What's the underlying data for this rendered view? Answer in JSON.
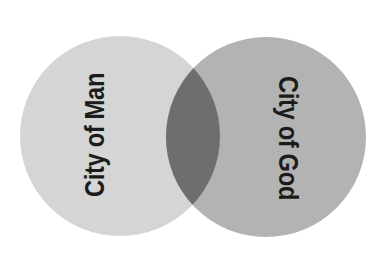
{
  "diagram": {
    "type": "venn",
    "title": "",
    "background_color": "#ffffff",
    "sets": [
      {
        "id": "city-of-man",
        "label": "City of Man",
        "fill_color": "#d5d5d5",
        "position": "left",
        "label_rotation_degrees": -90
      },
      {
        "id": "city-of-god",
        "label": "City of God",
        "fill_color": "#b3b3b3",
        "position": "right",
        "label_rotation_degrees": 90
      }
    ],
    "intersection": {
      "id": "city-of-man-and-city-of-god",
      "label": "",
      "fill_color": "#6e6e6e"
    },
    "label_color": "#1b1b1b"
  },
  "geometry": {
    "width": 385,
    "height": 270,
    "left_circle": {
      "cx": 120,
      "cy": 136,
      "r": 100
    },
    "right_circle": {
      "cx": 266,
      "cy": 137,
      "r": 100
    }
  }
}
